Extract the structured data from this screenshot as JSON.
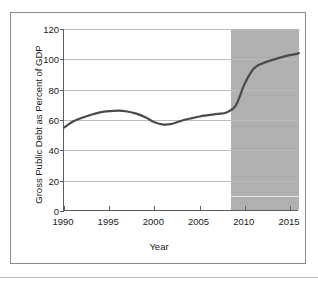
{
  "chart_data": {
    "type": "line",
    "title": "",
    "xlabel": "Year",
    "ylabel": "Gross Public Debt as Percent of GDP",
    "xlim": [
      1990,
      2016
    ],
    "ylim": [
      0,
      120
    ],
    "xticks": [
      1990,
      1995,
      2000,
      2005,
      2010,
      2015
    ],
    "xtick_labels": [
      "1990",
      "1995",
      "2000",
      "2005",
      "2010",
      "2015"
    ],
    "yticks": [
      0,
      20,
      40,
      60,
      80,
      100,
      120
    ],
    "ytick_labels": [
      "0",
      "20",
      "40",
      "60",
      "80",
      "100",
      "120"
    ],
    "grid": "horizontal",
    "legend": "none",
    "line_color": "#4a4a4a",
    "shade_color": "#b0b0b0",
    "gridline_color": "#bdbdbd",
    "axis_color": "#5d5d5d",
    "shaded_region": {
      "label": "projection",
      "x_start": 2008.5,
      "x_end": 2016
    },
    "x": [
      1990,
      1991,
      1992,
      1993,
      1994,
      1995,
      1996,
      1997,
      1998,
      1999,
      2000,
      2001,
      2002,
      2003,
      2004,
      2005,
      2006,
      2007,
      2008,
      2009,
      2010,
      2011,
      2012,
      2013,
      2014,
      2015,
      2016
    ],
    "values": [
      55.0,
      59.0,
      61.5,
      63.5,
      65.0,
      65.8,
      66.2,
      65.6,
      64.2,
      61.8,
      58.5,
      57.0,
      57.5,
      59.5,
      61.0,
      62.3,
      63.2,
      64.0,
      65.0,
      69.5,
      84.0,
      94.0,
      97.5,
      99.5,
      101.3,
      102.8,
      104.0
    ]
  }
}
